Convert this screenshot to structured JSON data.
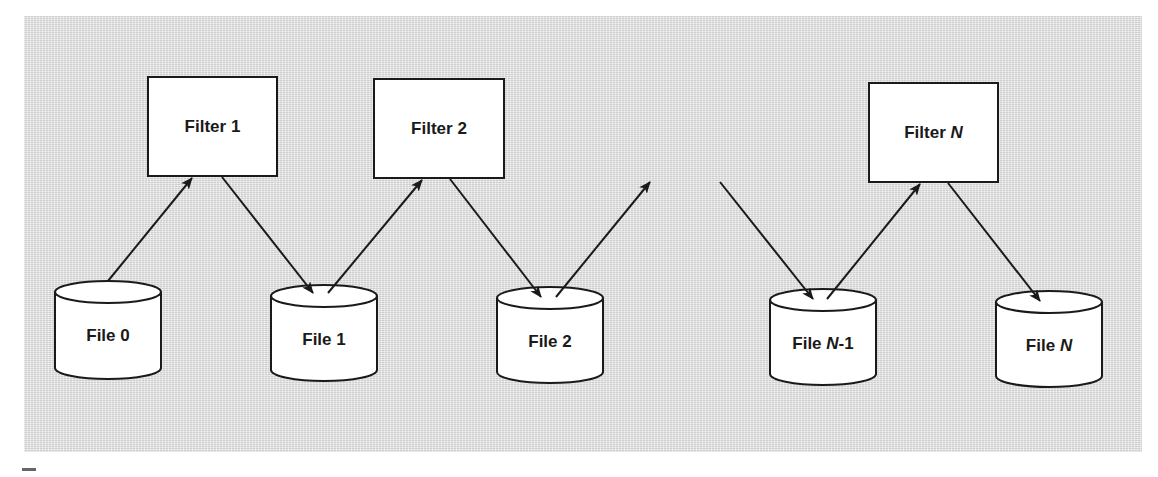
{
  "diagram": {
    "type": "pipe-and-filter pipeline",
    "background_color": "#e2e2e2",
    "stroke_color": "#1a1a1a",
    "filters": [
      {
        "id": "filter-1",
        "label_prefix": "Filter ",
        "label_suffix": "1",
        "suffix_italic": false
      },
      {
        "id": "filter-2",
        "label_prefix": "Filter ",
        "label_suffix": "2",
        "suffix_italic": false
      },
      {
        "id": "filter-n",
        "label_prefix": "Filter ",
        "label_suffix": "N",
        "suffix_italic": true
      }
    ],
    "files": [
      {
        "id": "file-0",
        "label_prefix": "File ",
        "label_var": "",
        "label_tail": "0"
      },
      {
        "id": "file-1",
        "label_prefix": "File ",
        "label_var": "",
        "label_tail": "1"
      },
      {
        "id": "file-2",
        "label_prefix": "File ",
        "label_var": "",
        "label_tail": "2"
      },
      {
        "id": "file-n-1",
        "label_prefix": "File ",
        "label_var": "N",
        "label_tail": "-1"
      },
      {
        "id": "file-n",
        "label_prefix": "File ",
        "label_var": "N",
        "label_tail": ""
      }
    ],
    "edges": [
      {
        "from": "File 0",
        "to": "Filter 1"
      },
      {
        "from": "Filter 1",
        "to": "File 1"
      },
      {
        "from": "File 1",
        "to": "Filter 2"
      },
      {
        "from": "Filter 2",
        "to": "File 2"
      },
      {
        "from": "File 2",
        "to": "(elided)"
      },
      {
        "from": "(elided)",
        "to": "File N-1"
      },
      {
        "from": "File N-1",
        "to": "Filter N"
      },
      {
        "from": "Filter N",
        "to": "File N"
      }
    ]
  }
}
